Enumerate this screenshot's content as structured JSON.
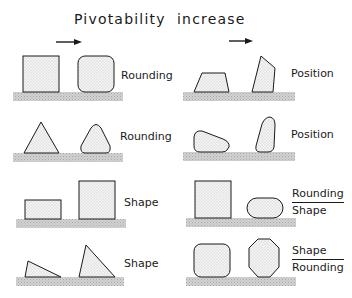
{
  "title": "Pivotability  increase",
  "arrows": [
    {
      "id": "left-column-arrow",
      "direction": "right"
    },
    {
      "id": "right-column-arrow",
      "direction": "right"
    }
  ],
  "rows": {
    "left": [
      {
        "label": "Rounding",
        "from": "square",
        "to": "rounded-square"
      },
      {
        "label": "Rounding",
        "from": "triangle",
        "to": "rounded-triangle"
      },
      {
        "label": "Shape",
        "from": "flat-rectangle",
        "to": "tall-square"
      },
      {
        "label": "Shape",
        "from": "low-triangle",
        "to": "tall-triangle"
      }
    ],
    "right": [
      {
        "label": "Position",
        "from": "trapezoid-on-base",
        "to": "trapezoid-on-edge"
      },
      {
        "label": "Position",
        "from": "rounded-block-lying",
        "to": "rounded-block-standing"
      },
      {
        "label_numerator": "Rounding",
        "label_denominator": "Shape",
        "from": "tall-square",
        "to": "rounded-capsule"
      },
      {
        "label_numerator": "Shape",
        "label_denominator": "Rounding",
        "from": "rounded-square",
        "to": "octagon"
      }
    ]
  },
  "colors": {
    "stroke": "#1a1a1a",
    "fill": "#ececec",
    "ground": "#c8c8c8"
  }
}
